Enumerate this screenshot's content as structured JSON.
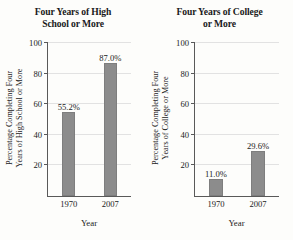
{
  "chart_data": [
    {
      "type": "bar",
      "title": "Four Years of High School or More",
      "title_lines": [
        "Four Years of High",
        "School or More"
      ],
      "categories": [
        "1970",
        "2007"
      ],
      "values": [
        55.2,
        87.0
      ],
      "data_labels": [
        "55.2%",
        "87.0%"
      ],
      "xlabel": "Year",
      "ylabel": "Percentage Completing Four Years of High School or More",
      "ylabel_lines": [
        "Percentage Completing Four",
        "Years of High School or More"
      ],
      "ylim": [
        0,
        100
      ],
      "yticks": [
        20,
        40,
        60,
        80,
        100
      ],
      "ytick_labels": [
        "20",
        "40",
        "60",
        "80",
        "100"
      ],
      "grid": true,
      "legend": "none",
      "bar_color": "#8c8c8c"
    },
    {
      "type": "bar",
      "title": "Four Years of College or More",
      "title_lines": [
        "Four Years of College",
        "or More"
      ],
      "categories": [
        "1970",
        "2007"
      ],
      "values": [
        11.0,
        29.6
      ],
      "data_labels": [
        "11.0%",
        "29.6%"
      ],
      "xlabel": "Year",
      "ylabel": "Percentage Completing Four Years of College or More",
      "ylabel_lines": [
        "Percentage Completing Four",
        "Years of College or More"
      ],
      "ylim": [
        0,
        100
      ],
      "yticks": [
        20,
        40,
        60,
        80,
        100
      ],
      "ytick_labels": [
        "20",
        "40",
        "60",
        "80",
        "100"
      ],
      "grid": true,
      "legend": "none",
      "bar_color": "#8c8c8c"
    }
  ]
}
